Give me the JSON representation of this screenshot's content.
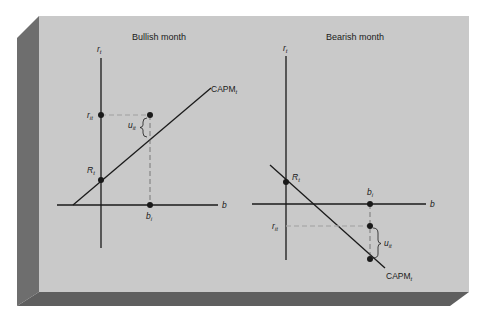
{
  "figure": {
    "colors": {
      "background": "#ffffff",
      "panel_face": "#c9c9c9",
      "panel_left_edge": "#6e6e6e",
      "panel_bottom_edge": "#5f5f5f",
      "ink": "#1a1a1a",
      "dash": "#f2f2f2"
    }
  },
  "panels": [
    {
      "title": "Bullish month",
      "y_axis_label": "r",
      "y_axis_sub": "t",
      "x_axis_label": "b",
      "line_label": "CAPM",
      "line_label_sub": "t",
      "intercept_label": "R",
      "intercept_sub": "t",
      "return_label": "r",
      "return_sub": "it",
      "beta_label": "b",
      "beta_sub": "i",
      "residual_label": "u",
      "residual_sub": "it"
    },
    {
      "title": "Bearish month",
      "y_axis_label": "r",
      "y_axis_sub": "t",
      "x_axis_label": "b",
      "line_label": "CAPM",
      "line_label_sub": "t",
      "intercept_label": "R",
      "intercept_sub": "t",
      "return_label": "r",
      "return_sub": "it",
      "beta_label": "b",
      "beta_sub": "i",
      "residual_label": "u",
      "residual_sub": "it"
    }
  ]
}
